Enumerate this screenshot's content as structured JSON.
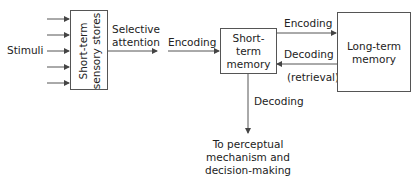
{
  "diagram": {
    "nodes": {
      "stimuli": {
        "label": "Stimuli"
      },
      "sensory_stores": {
        "line1": "Short-term",
        "line2": "sensory stores"
      },
      "short_term_memory": {
        "line1": "Short-",
        "line2": "term",
        "line3": "memory"
      },
      "long_term_memory": {
        "line1": "Long-term",
        "line2": "memory"
      },
      "output": {
        "line1": "To perceptual",
        "line2": "mechanism and",
        "line3": "decision-making"
      }
    },
    "edges": {
      "selective_attention": {
        "line1": "Selective",
        "line2": "attention"
      },
      "encoding_to_stm": {
        "label": "Encoding"
      },
      "encoding_to_ltm": {
        "label": "Encoding"
      },
      "decoding_from_ltm": {
        "label": "Decoding"
      },
      "retrieval": {
        "label": "(retrieval)"
      },
      "decoding_down": {
        "label": "Decoding"
      }
    },
    "stimuli_arrow_count": 5,
    "colors": {
      "line": "#555555",
      "text": "#222222",
      "background": "#ffffff"
    }
  }
}
